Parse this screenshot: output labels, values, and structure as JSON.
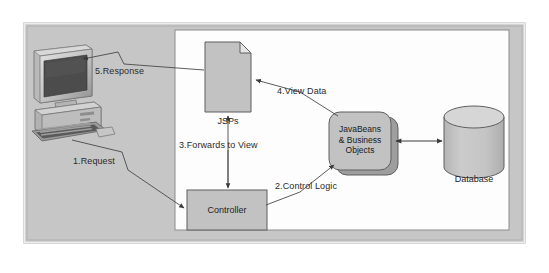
{
  "figure": {
    "type": "architecture-flow-diagram"
  },
  "colors": {
    "outer_panel_fill": "#c9c9c9",
    "outer_panel_border": "#9a9a9a",
    "inner_panel_fill": "#fdfdfd",
    "inner_panel_border": "#8c8c8c",
    "node_fill": "#c2c2c2",
    "node_border": "#6e6e6e",
    "shadow_fill": "#9e9e9e",
    "line": "#4a4a4a",
    "text": "#1e1e1e",
    "page_background": "#ffffff"
  },
  "nodes": {
    "client": {
      "label": "",
      "icon": "desktop-computer-icon"
    },
    "jsps": {
      "label": "JSPs",
      "shape": "document-page"
    },
    "controller": {
      "label": "Controller",
      "shape": "rectangle"
    },
    "javabeans": {
      "line1": "JavaBeans",
      "line2": "& Business",
      "line3": "Objects",
      "shape": "rounded-rectangle-stacked"
    },
    "database": {
      "label": "Database",
      "shape": "cylinder"
    }
  },
  "flows": [
    {
      "id": "1",
      "label": "1.Request",
      "from": "client",
      "to": "controller"
    },
    {
      "id": "2",
      "label": "2.Control Logic",
      "from": "controller",
      "to": "javabeans"
    },
    {
      "id": "3",
      "label": "3.Forwards to View",
      "from": "jsps",
      "to": "controller"
    },
    {
      "id": "4",
      "label": "4.View Data",
      "from": "javabeans",
      "to": "jsps"
    },
    {
      "id": "5",
      "label": "5.Response",
      "from": "jsps",
      "to": "client"
    }
  ],
  "labels": {
    "request": "1.Request",
    "control_logic": "2.Control Logic",
    "forwards_to_view": "3.Forwards to View",
    "view_data": "4.View Data",
    "response": "5.Response",
    "jsps": "JSPs",
    "controller": "Controller",
    "database": "Database",
    "javabeans_line1": "JavaBeans",
    "javabeans_line2": "& Business",
    "javabeans_line3": "Objects"
  }
}
